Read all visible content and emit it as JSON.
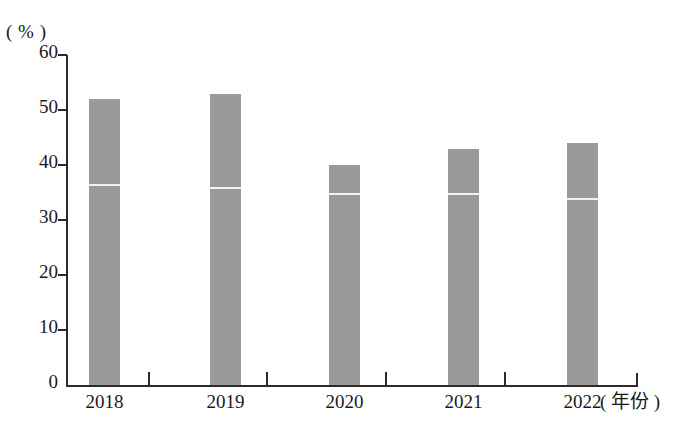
{
  "chart_data": {
    "type": "bar",
    "title": "",
    "subtitle": "",
    "xlabel": "( 年份 )",
    "ylabel": "( % )",
    "categories": [
      "2018",
      "2019",
      "2020",
      "2021",
      "2022"
    ],
    "values": [
      52,
      53,
      40,
      43,
      44
    ],
    "series": [
      {
        "name": "比例",
        "values": [
          52,
          53,
          40,
          43,
          44
        ]
      },
      {
        "name": "分段标记线",
        "values": [
          36.5,
          36,
          35,
          35,
          34
        ]
      }
    ],
    "annotations": [
      {
        "category": "2018",
        "marker_value": 36.5
      },
      {
        "category": "2019",
        "marker_value": 36
      },
      {
        "category": "2020",
        "marker_value": 35
      },
      {
        "category": "2021",
        "marker_value": 35
      },
      {
        "category": "2022",
        "marker_value": 34
      }
    ],
    "ylim": [
      0,
      60
    ],
    "ytick_labels": [
      "60",
      "50",
      "40",
      "30",
      "20",
      "10",
      "0"
    ],
    "ytick_values": [
      60,
      50,
      40,
      30,
      20,
      10,
      0
    ],
    "grid": false,
    "legend": false,
    "legend_position": "none",
    "bar_color": "#9a9a9a",
    "marker_color": "#f2f2f2",
    "axis_color": "#2b2b2b"
  },
  "axes": {
    "y_unit_label": "( % )",
    "x_unit_label": "( 年份 )"
  }
}
